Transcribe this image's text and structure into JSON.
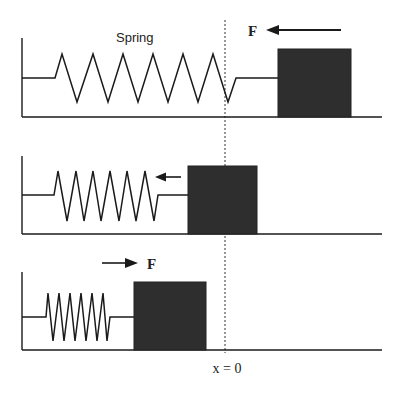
{
  "labels": {
    "spring": "Spring",
    "force": "F",
    "origin": "x = 0"
  },
  "colors": {
    "block": "#2e2e2e",
    "line": "#1a1a1a",
    "background": "#ffffff"
  },
  "panels": [
    {
      "name": "stretched",
      "force_direction": "left",
      "block_position": "right-of-origin"
    },
    {
      "name": "equilibrium",
      "force_direction": "left",
      "block_position": "at-origin"
    },
    {
      "name": "compressed",
      "force_direction": "right",
      "block_position": "left-of-origin"
    }
  ]
}
